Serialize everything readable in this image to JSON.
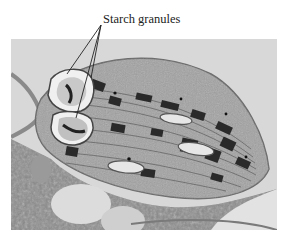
{
  "figure": {
    "label": "Starch granules",
    "colors": {
      "background": "#ffffff",
      "label_text": "#222222",
      "stroma": "#9a9a9a",
      "grana": "#2a2a2a",
      "starch": "#e8e8e8"
    }
  }
}
